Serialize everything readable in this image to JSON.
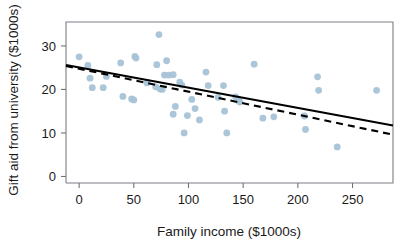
{
  "chart_data": {
    "type": "scatter",
    "title": "",
    "xlabel": "Family income ($1000s)",
    "ylabel": "Gift aid from university ($1000s)",
    "xlim": [
      -12,
      287
    ],
    "ylim": [
      -1.5,
      35.5
    ],
    "xticks": [
      0,
      50,
      100,
      150,
      200,
      250
    ],
    "xtick_labels": [
      "0",
      "50",
      "100",
      "150",
      "200",
      "250"
    ],
    "yticks": [
      0,
      10,
      20,
      30
    ],
    "ytick_labels": [
      "0",
      "10",
      "20",
      "30"
    ],
    "grid": false,
    "legend": "none",
    "point_color": "#a6c3d6",
    "line_color": "#000000",
    "points": [
      {
        "x": 0,
        "y": 27.5
      },
      {
        "x": 8,
        "y": 25.5
      },
      {
        "x": 10,
        "y": 22.6
      },
      {
        "x": 12,
        "y": 20.4
      },
      {
        "x": 22,
        "y": 20.4
      },
      {
        "x": 25,
        "y": 23.0
      },
      {
        "x": 38,
        "y": 26.1
      },
      {
        "x": 40,
        "y": 18.4
      },
      {
        "x": 48,
        "y": 17.8
      },
      {
        "x": 50,
        "y": 17.6
      },
      {
        "x": 51,
        "y": 27.6
      },
      {
        "x": 52,
        "y": 27.2
      },
      {
        "x": 62,
        "y": 21.5
      },
      {
        "x": 70,
        "y": 20.6
      },
      {
        "x": 71,
        "y": 25.7
      },
      {
        "x": 73,
        "y": 32.6
      },
      {
        "x": 74,
        "y": 20.1
      },
      {
        "x": 76,
        "y": 20.0
      },
      {
        "x": 78,
        "y": 23.3
      },
      {
        "x": 80,
        "y": 26.6
      },
      {
        "x": 82,
        "y": 23.3
      },
      {
        "x": 86,
        "y": 23.4
      },
      {
        "x": 86,
        "y": 14.3
      },
      {
        "x": 88,
        "y": 16.1
      },
      {
        "x": 92,
        "y": 21.7
      },
      {
        "x": 94,
        "y": 21.0
      },
      {
        "x": 96,
        "y": 10.0
      },
      {
        "x": 99,
        "y": 14.0
      },
      {
        "x": 103,
        "y": 17.7
      },
      {
        "x": 106,
        "y": 15.6
      },
      {
        "x": 110,
        "y": 13.0
      },
      {
        "x": 116,
        "y": 24.0
      },
      {
        "x": 118,
        "y": 20.9
      },
      {
        "x": 127,
        "y": 18.2
      },
      {
        "x": 132,
        "y": 20.9
      },
      {
        "x": 133,
        "y": 15.0
      },
      {
        "x": 135,
        "y": 10.0
      },
      {
        "x": 143,
        "y": 18.3
      },
      {
        "x": 146,
        "y": 17.4
      },
      {
        "x": 147,
        "y": 17.1
      },
      {
        "x": 160,
        "y": 25.8
      },
      {
        "x": 168,
        "y": 13.4
      },
      {
        "x": 178,
        "y": 13.7
      },
      {
        "x": 206,
        "y": 13.9
      },
      {
        "x": 207,
        "y": 10.8
      },
      {
        "x": 218,
        "y": 22.9
      },
      {
        "x": 219,
        "y": 19.8
      },
      {
        "x": 236,
        "y": 6.8
      },
      {
        "x": 272,
        "y": 19.8
      }
    ],
    "fit_lines": [
      {
        "name": "solid-regression-line",
        "style": "solid",
        "x0": -12,
        "y0": 25.6,
        "x1": 287,
        "y1": 11.7
      },
      {
        "name": "dashed-regression-line",
        "style": "dashed",
        "x0": -12,
        "y0": 25.4,
        "x1": 287,
        "y1": 9.6
      }
    ]
  }
}
